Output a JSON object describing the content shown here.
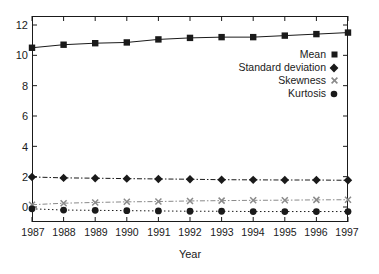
{
  "chart_data": {
    "type": "line",
    "title": "",
    "xlabel": "Year",
    "ylabel": "",
    "x": [
      1987,
      1988,
      1989,
      1990,
      1991,
      1992,
      1993,
      1994,
      1995,
      1996,
      1997
    ],
    "categories": [
      "1987",
      "1988",
      "1989",
      "1990",
      "1991",
      "1992",
      "1993",
      "1994",
      "1995",
      "1996",
      "1997"
    ],
    "xlim": [
      1987,
      1997
    ],
    "ylim": [
      -0.8,
      12.6
    ],
    "yticks": [
      0,
      2,
      4,
      6,
      8,
      10,
      12
    ],
    "ytick_labels": [
      "0",
      "2",
      "4",
      "6",
      "8",
      "10",
      "12"
    ],
    "grid": false,
    "legend_position": "upper right",
    "series": [
      {
        "name": "Mean",
        "marker": "square",
        "linestyle": "solid",
        "color": "#1a1a1a",
        "values": [
          10.5,
          10.7,
          10.8,
          10.85,
          11.05,
          11.15,
          11.2,
          11.2,
          11.3,
          11.4,
          11.5
        ]
      },
      {
        "name": "Standard deviation",
        "marker": "diamond",
        "linestyle": "dash-dot",
        "color": "#1a1a1a",
        "values": [
          1.98,
          1.92,
          1.9,
          1.87,
          1.85,
          1.83,
          1.8,
          1.79,
          1.78,
          1.78,
          1.76
        ]
      },
      {
        "name": "Skewness",
        "marker": "cross",
        "linestyle": "dash-dot",
        "color": "#8a8a8a",
        "values": [
          0.15,
          0.25,
          0.3,
          0.34,
          0.36,
          0.4,
          0.42,
          0.44,
          0.45,
          0.47,
          0.48
        ]
      },
      {
        "name": "Kurtosis",
        "marker": "circle",
        "linestyle": "dotted",
        "color": "#1a1a1a",
        "values": [
          -0.12,
          -0.2,
          -0.22,
          -0.24,
          -0.26,
          -0.28,
          -0.28,
          -0.3,
          -0.3,
          -0.3,
          -0.3
        ]
      }
    ]
  },
  "axis": {
    "xlabel": "Year",
    "ytick_labels": [
      "12",
      "10",
      "8",
      "6",
      "4",
      "2",
      "0"
    ],
    "xtick_labels": [
      "1987",
      "1988",
      "1989",
      "1990",
      "1991",
      "1992",
      "1993",
      "1994",
      "1995",
      "1996",
      "1997"
    ]
  },
  "legend": {
    "items": [
      {
        "label": "Mean",
        "marker": "square-marker-icon"
      },
      {
        "label": "Standard deviation",
        "marker": "diamond-marker-icon"
      },
      {
        "label": "Skewness",
        "marker": "cross-marker-icon"
      },
      {
        "label": "Kurtosis",
        "marker": "circle-marker-icon"
      }
    ]
  },
  "colors": {
    "axis": "#1a1a1a",
    "mean": "#1a1a1a",
    "std": "#1a1a1a",
    "skewness": "#8a8a8a",
    "kurtosis": "#1a1a1a",
    "background": "#ffffff"
  }
}
